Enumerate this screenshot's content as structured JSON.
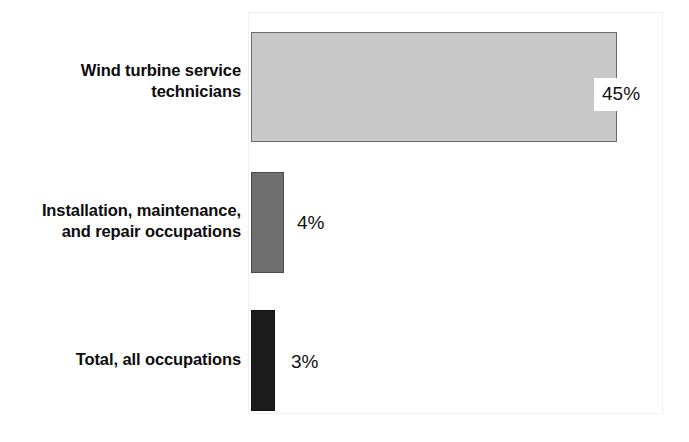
{
  "chart_data": {
    "type": "bar",
    "orientation": "horizontal",
    "title": "",
    "subtitle": "",
    "xlabel": "",
    "ylabel": "",
    "categories": [
      "Wind turbine service technicians",
      "Installation, maintenance, and repair occupations",
      "Total, all occupations"
    ],
    "values": [
      45,
      4,
      3
    ],
    "value_labels": [
      "45%",
      "4%",
      "3%"
    ],
    "units": "percent",
    "xlim": [
      0,
      48
    ],
    "grid": false,
    "legend": null,
    "annotations": [],
    "series": [
      {
        "name": "Percent change, 2022-32",
        "values": [
          45,
          4,
          3
        ]
      }
    ]
  },
  "chart": {
    "bars": [
      {
        "label_line1": "Wind turbine service",
        "label_line2": "technicians",
        "value_label": "45%",
        "value": 45,
        "fill": "#c8c8c8",
        "stroke": "#6a6a6a"
      },
      {
        "label_line1": "Installation, maintenance,",
        "label_line2": "and repair occupations",
        "value_label": "4%",
        "value": 4,
        "fill": "#6e6e6e",
        "stroke": "#4a4a4a"
      },
      {
        "label_line1": "Total, all occupations",
        "label_line2": "",
        "value_label": "3%",
        "value": 3,
        "fill": "#1c1c1c",
        "stroke": "#111111"
      }
    ],
    "plot_border_color": "#f1f1f1",
    "background_color": "#ffffff",
    "text_color": "#0d0d0d"
  }
}
